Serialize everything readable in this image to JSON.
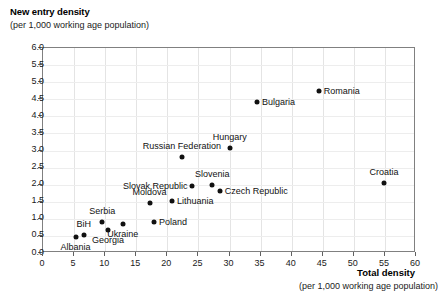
{
  "chart_data": {
    "type": "scatter",
    "title": "New entry density",
    "subtitle": "(per 1,000 working age population)",
    "ylabel": "New entry density",
    "ylabel_sub": "(per 1,000 working age population)",
    "xlabel": "Total density",
    "xlabel_sub": "(per 1,000 working age population)",
    "xlim": [
      0,
      60
    ],
    "ylim": [
      0.0,
      6.0
    ],
    "xticks": [
      0,
      5,
      10,
      15,
      20,
      25,
      30,
      35,
      40,
      45,
      50,
      55,
      60
    ],
    "xtick_labels": [
      "0",
      "5",
      "10",
      "15",
      "20",
      "25",
      "30",
      "35",
      "40",
      "45",
      "50",
      "55",
      "60"
    ],
    "yticks": [
      0.0,
      0.5,
      1.0,
      1.5,
      2.0,
      2.5,
      3.0,
      3.5,
      4.0,
      4.5,
      5.0,
      5.5,
      6.0
    ],
    "ytick_labels": [
      "0.0",
      "0.5",
      "1.0",
      "1.5",
      "2.0",
      "2.5",
      "3.0",
      "3.5",
      "4.0",
      "4.5",
      "5.0",
      "5.5",
      "6.0"
    ],
    "grid": true,
    "legend": false,
    "marker": "filled-circle",
    "marker_color": "#111111",
    "points": [
      {
        "label": "Romania",
        "x": 44.5,
        "y": 4.7,
        "label_pos": "right"
      },
      {
        "label": "Bulgaria",
        "x": 34.6,
        "y": 4.38,
        "label_pos": "right"
      },
      {
        "label": "Hungary",
        "x": 30.2,
        "y": 3.05,
        "label_pos": "above"
      },
      {
        "label": "Russian Federation",
        "x": 22.5,
        "y": 2.77,
        "label_pos": "above"
      },
      {
        "label": "Croatia",
        "x": 55.0,
        "y": 2.02,
        "label_pos": "above"
      },
      {
        "label": "Slovenia",
        "x": 27.4,
        "y": 1.95,
        "label_pos": "above"
      },
      {
        "label": "Slovak Republic",
        "x": 24.2,
        "y": 1.92,
        "label_pos": "left"
      },
      {
        "label": "Czech Republic",
        "x": 28.6,
        "y": 1.8,
        "label_pos": "right"
      },
      {
        "label": "Lithuania",
        "x": 20.9,
        "y": 1.48,
        "label_pos": "right"
      },
      {
        "label": "Moldova",
        "x": 17.3,
        "y": 1.44,
        "label_pos": "above"
      },
      {
        "label": "Poland",
        "x": 18.0,
        "y": 0.89,
        "label_pos": "right"
      },
      {
        "label": "Serbia",
        "x": 9.7,
        "y": 0.88,
        "label_pos": "above"
      },
      {
        "label": "Ukraine",
        "x": 13.0,
        "y": 0.83,
        "label_pos": "below"
      },
      {
        "label": "Georgia",
        "x": 10.6,
        "y": 0.63,
        "label_pos": "below"
      },
      {
        "label": "BiH",
        "x": 6.7,
        "y": 0.49,
        "label_pos": "above"
      },
      {
        "label": "Albania",
        "x": 5.4,
        "y": 0.43,
        "label_pos": "below"
      }
    ]
  }
}
